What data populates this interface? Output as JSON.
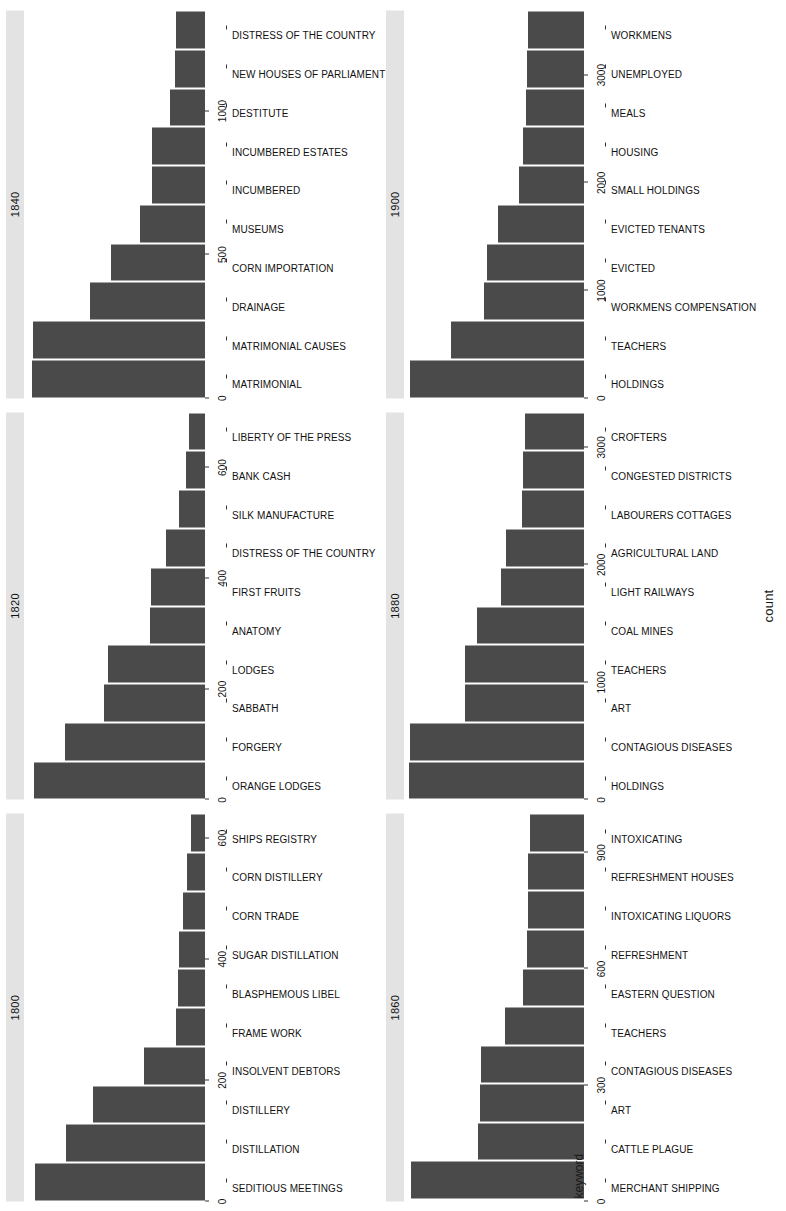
{
  "chart_data": {
    "type": "bar",
    "title": "",
    "xlabel": "count",
    "ylabel": "keyword",
    "grid": false,
    "legend": "none",
    "orientation": "horizontal-facets",
    "facet_layout": "2 rows x 3 columns",
    "panels": [
      {
        "facet_label": "1800",
        "xlim": [
          0,
          640
        ],
        "xticks": [
          0,
          200,
          400,
          600
        ],
        "xticklabels": [
          "0",
          "200",
          "400",
          "600"
        ],
        "categories": [
          "SEDITIOUS MEETINGS",
          "DISTILLATION",
          "DISTILLERY",
          "INSOLVENT DEBTORS",
          "FRAME WORK",
          "BLASPHEMOUS LIBEL",
          "SUGAR DISTILLATION",
          "CORN TRADE",
          "CORN DISTILLERY",
          "SHIPS REGISTRY"
        ],
        "values": [
          600,
          490,
          395,
          215,
          100,
          95,
          92,
          78,
          62,
          48
        ]
      },
      {
        "facet_label": "1820",
        "xlim": [
          0,
          700
        ],
        "xticks": [
          0,
          200,
          400,
          600
        ],
        "xticklabels": [
          "0",
          "200",
          "400",
          "600"
        ],
        "categories": [
          "ORANGE LODGES",
          "FORGERY",
          "SABBATH",
          "LODGES",
          "ANATOMY",
          "FIRST FRUITS",
          "DISTRESS OF THE COUNTRY",
          "SILK MANUFACTURE",
          "BANK CASH",
          "LIBERTY OF THE PRESS"
        ],
        "values": [
          660,
          540,
          390,
          375,
          210,
          208,
          148,
          100,
          72,
          62
        ]
      },
      {
        "facet_label": "1840",
        "xlim": [
          0,
          1350
        ],
        "xticks": [
          0,
          500,
          1000
        ],
        "xticklabels": [
          "0",
          "500",
          "1000"
        ],
        "categories": [
          "MATRIMONIAL",
          "MATRIMONIAL CAUSES",
          "DRAINAGE",
          "CORN IMPORTATION",
          "MUSEUMS",
          "INCUMBERED",
          "INCUMBERED ESTATES",
          "DESTITUTE",
          "NEW HOUSES OF PARLIAMENT",
          "DISTRESS OF THE COUNTRY"
        ],
        "values": [
          1290,
          1285,
          855,
          700,
          480,
          390,
          395,
          260,
          220,
          215
        ]
      },
      {
        "facet_label": "1860",
        "xlim": [
          0,
          1000
        ],
        "xticks": [
          0,
          300,
          600,
          900
        ],
        "xticklabels": [
          "0",
          "300",
          "600",
          "900"
        ],
        "categories": [
          "MERCHANT SHIPPING",
          "CATTLE PLAGUE",
          "ART",
          "CONTAGIOUS DISEASES",
          "TEACHERS",
          "EASTERN QUESTION",
          "REFRESHMENT",
          "INTOXICATING LIQUORS",
          "REFRESHMENT HOUSES",
          "INTOXICATING"
        ],
        "values": [
          960,
          590,
          575,
          570,
          440,
          340,
          315,
          312,
          308,
          300
        ]
      },
      {
        "facet_label": "1880",
        "xlim": [
          0,
          3300
        ],
        "xticks": [
          0,
          1000,
          2000,
          3000
        ],
        "xticklabels": [
          "0",
          "1000",
          "2000",
          "3000"
        ],
        "categories": [
          "HOLDINGS",
          "CONTAGIOUS DISEASES",
          "ART",
          "TEACHERS",
          "COAL MINES",
          "LIGHT RAILWAYS",
          "AGRICULTURAL LAND",
          "LABOURERS COTTAGES",
          "CONGESTED DISTRICTS",
          "CROFTERS"
        ],
        "values": [
          3200,
          3190,
          2180,
          2170,
          1960,
          1520,
          1430,
          1140,
          1110,
          1075
        ]
      },
      {
        "facet_label": "1900",
        "xlim": [
          0,
          3600
        ],
        "xticks": [
          0,
          1000,
          2000,
          3000
        ],
        "xticklabels": [
          "0",
          "1000",
          "2000",
          "3000"
        ],
        "categories": [
          "HOLDINGS",
          "TEACHERS",
          "WORKMENS COMPENSATION",
          "EVICTED",
          "EVICTED TENANTS",
          "SMALL HOLDINGS",
          "HOUSING",
          "MEALS",
          "UNEMPLOYED",
          "WORKMENS"
        ],
        "values": [
          3480,
          2650,
          2000,
          1930,
          1720,
          1290,
          1210,
          1160,
          1130,
          1125
        ]
      }
    ]
  },
  "axes": {
    "x_title": "count",
    "y_title": "keyword"
  },
  "colors": {
    "bar": "#4a4a4a",
    "strip_background": "#e3e3e3",
    "panel_background": "#ffffff",
    "text": "#111111"
  },
  "caption": ""
}
